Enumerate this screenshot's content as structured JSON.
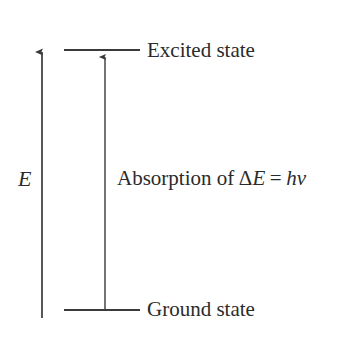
{
  "diagram": {
    "background_color": "#ffffff",
    "stroke_color": "#3a3a3a",
    "text_color": "#2b2b2b",
    "axis": {
      "label": "E",
      "meaning": "Energy",
      "direction": "up",
      "arrow_name": "energy-axis-arrow"
    },
    "levels": [
      {
        "id": "excited",
        "label": "Excited state",
        "y": 50,
        "x_start": 64,
        "x_end": 140
      },
      {
        "id": "ground",
        "label": "Ground state",
        "y": 310,
        "x_start": 64,
        "x_end": 140
      }
    ],
    "transition": {
      "name": "absorption-arrow",
      "direction": "up",
      "from_level": "ground",
      "to_level": "excited",
      "x": 105,
      "y_start": 310,
      "y_end": 50,
      "caption": {
        "prefix": "Absorption of",
        "delta": "Δ",
        "energy_symbol": "E",
        "equals": "=",
        "planck": "h",
        "nu": "ν",
        "full_text": "Absorption of ΔE = hν"
      }
    }
  }
}
